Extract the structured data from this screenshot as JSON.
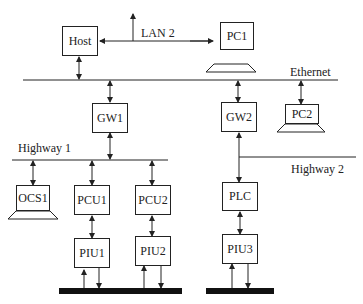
{
  "diagram": {
    "networks": {
      "lan2": "LAN 2",
      "ethernet": "Ethernet",
      "highway1": "Highway 1",
      "highway2": "Highway 2"
    },
    "nodes": {
      "host": "Host",
      "pc1": "PC1",
      "pc2": "PC2",
      "gw1": "GW1",
      "gw2": "GW2",
      "ocs1": "OCS1",
      "pcu1": "PCU1",
      "pcu2": "PCU2",
      "plc": "PLC",
      "piu1": "PIU1",
      "piu2": "PIU2",
      "piu3": "PIU3"
    },
    "colors": {
      "line": "#222222",
      "background": "#ffffff"
    }
  }
}
